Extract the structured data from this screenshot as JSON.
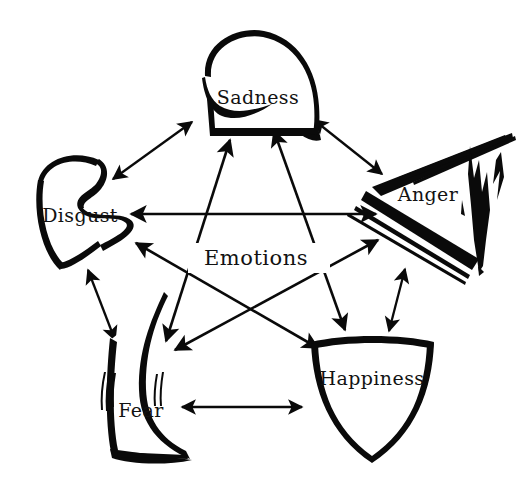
{
  "diagram": {
    "title": "Emotions",
    "center_label": "Emotions",
    "background_color": "#ffffff",
    "ink_color": "#0a0a0a",
    "canvas": {
      "width": 524,
      "height": 488
    },
    "layout": "pentagon-with-pentagram",
    "nodes": [
      {
        "id": "sadness",
        "label": "Sadness",
        "shape": "drooping-melting-shield",
        "position": "top",
        "cx": 258,
        "cy": 99,
        "label_x": 258,
        "label_y": 99
      },
      {
        "id": "anger",
        "label": "Anger",
        "shape": "jagged-spiked-shard-shield",
        "position": "right",
        "cx": 428,
        "cy": 196,
        "label_x": 428,
        "label_y": 196
      },
      {
        "id": "happiness",
        "label": "Happiness",
        "shape": "clean-symmetric-shield",
        "position": "bottom-right",
        "cx": 372,
        "cy": 380,
        "label_x": 372,
        "label_y": 380
      },
      {
        "id": "fear",
        "label": "Fear",
        "shape": "trembling-shivering-shield",
        "position": "bottom-left",
        "cx": 141,
        "cy": 412,
        "label_x": 141,
        "label_y": 412
      },
      {
        "id": "disgust",
        "label": "Disgust",
        "shape": "wavy-recoiling-shield",
        "position": "left",
        "cx": 80,
        "cy": 217,
        "label_x": 80,
        "label_y": 217
      }
    ],
    "edges": [
      {
        "id": "disgust-sadness",
        "from": "disgust",
        "to": "sadness",
        "kind": "pentagon-outer",
        "arrow": "double"
      },
      {
        "id": "sadness-anger",
        "from": "sadness",
        "to": "anger",
        "kind": "pentagon-outer",
        "arrow": "double"
      },
      {
        "id": "anger-happiness",
        "from": "anger",
        "to": "happiness",
        "kind": "pentagon-outer",
        "arrow": "double"
      },
      {
        "id": "happiness-fear",
        "from": "happiness",
        "to": "fear",
        "kind": "pentagon-outer",
        "arrow": "double"
      },
      {
        "id": "fear-disgust",
        "from": "fear",
        "to": "disgust",
        "kind": "pentagon-outer",
        "arrow": "double"
      },
      {
        "id": "disgust-anger",
        "from": "disgust",
        "to": "anger",
        "kind": "pentagram-inner",
        "arrow": "double"
      },
      {
        "id": "sadness-happiness",
        "from": "sadness",
        "to": "happiness",
        "kind": "pentagram-inner",
        "arrow": "double"
      },
      {
        "id": "anger-fear",
        "from": "anger",
        "to": "fear",
        "kind": "pentagram-inner",
        "arrow": "double"
      },
      {
        "id": "happiness-disgust",
        "from": "happiness",
        "to": "disgust",
        "kind": "pentagram-inner",
        "arrow": "double"
      },
      {
        "id": "fear-sadness",
        "from": "fear",
        "to": "sadness",
        "kind": "pentagram-inner",
        "arrow": "double"
      }
    ]
  }
}
